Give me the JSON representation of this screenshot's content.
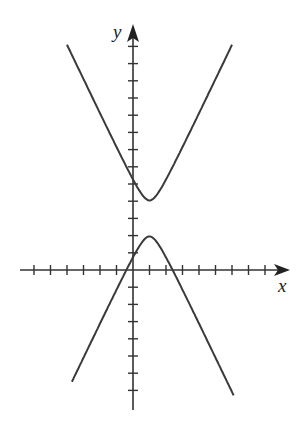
{
  "chart_data": {
    "type": "line",
    "title": "",
    "xlabel": "x",
    "ylabel": "y",
    "xlim": [
      -6.5,
      9
    ],
    "ylim": [
      -8.3,
      13.8
    ],
    "grid": false,
    "legend": null,
    "x_ticks": [
      -6,
      -5,
      -4,
      -3,
      -2,
      -1,
      1,
      2,
      3,
      4,
      5,
      6,
      7,
      8
    ],
    "y_ticks": [
      -7,
      -6,
      -5,
      -4,
      -3,
      -2,
      -1,
      1,
      2,
      3,
      4,
      5,
      6,
      7,
      8,
      9,
      10,
      11,
      12,
      13
    ],
    "tick_labels_shown": false,
    "series": [
      {
        "name": "hyperbola",
        "equation": "(y-3)^2 - 4(x-1)^2 = 1 (approx.)",
        "center": [
          1,
          3
        ],
        "vertices": [
          [
            1,
            4
          ],
          [
            1,
            2
          ]
        ],
        "x_intercepts": [
          -0.3,
          2.35
        ],
        "branches": [
          {
            "name": "upper-branch",
            "x_range": [
              -4,
              6
            ]
          },
          {
            "name": "lower-branch",
            "x_range": [
              -3.7,
              6.1
            ]
          }
        ]
      }
    ]
  },
  "labels": {
    "x_axis": "x",
    "y_axis": "y"
  },
  "colors": {
    "axis": "#333333",
    "curve": "#3a3a3a",
    "background": "#ffffff"
  }
}
